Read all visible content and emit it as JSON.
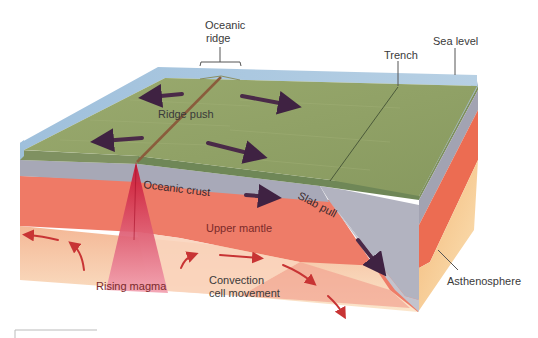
{
  "diagram": {
    "labels": {
      "oceanic_ridge_line1": "Oceanic",
      "oceanic_ridge_line2": "ridge",
      "trench": "Trench",
      "sea_level": "Sea level",
      "ridge_push": "Ridge push",
      "oceanic_crust": "Oceanic crust",
      "slab_pull": "Slab pull",
      "upper_mantle": "Upper mantle",
      "rising_magma": "Rising magma",
      "convection_line1": "Convection",
      "convection_line2": "cell movement",
      "asthenosphere": "Asthenosphere"
    },
    "colors": {
      "water": "#a9c6dd",
      "seafloor": "#8fa06a",
      "crust": "#a9a9b4",
      "upper_mantle": "#ec7a66",
      "asthenosphere": "#f6caa0",
      "magma": "#d8385c",
      "force_arrow": "#4a2a48",
      "convection_arrow": "#c83a3a"
    }
  }
}
